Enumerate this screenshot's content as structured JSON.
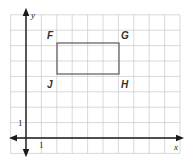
{
  "graph": {
    "axes": {
      "x_label": "x",
      "y_label": "y",
      "x_tick_label": "1",
      "y_tick_label": "1"
    },
    "grid": {
      "x_min": -1,
      "x_max": 10,
      "y_min": -1,
      "y_max": 8,
      "unit": 1
    },
    "rectangle": {
      "stroke_color": "#666666",
      "vertices": [
        {
          "label": "F",
          "x": 2,
          "y": 6
        },
        {
          "label": "G",
          "x": 6,
          "y": 6
        },
        {
          "label": "H",
          "x": 6,
          "y": 4
        },
        {
          "label": "J",
          "x": 2,
          "y": 4
        }
      ]
    }
  }
}
